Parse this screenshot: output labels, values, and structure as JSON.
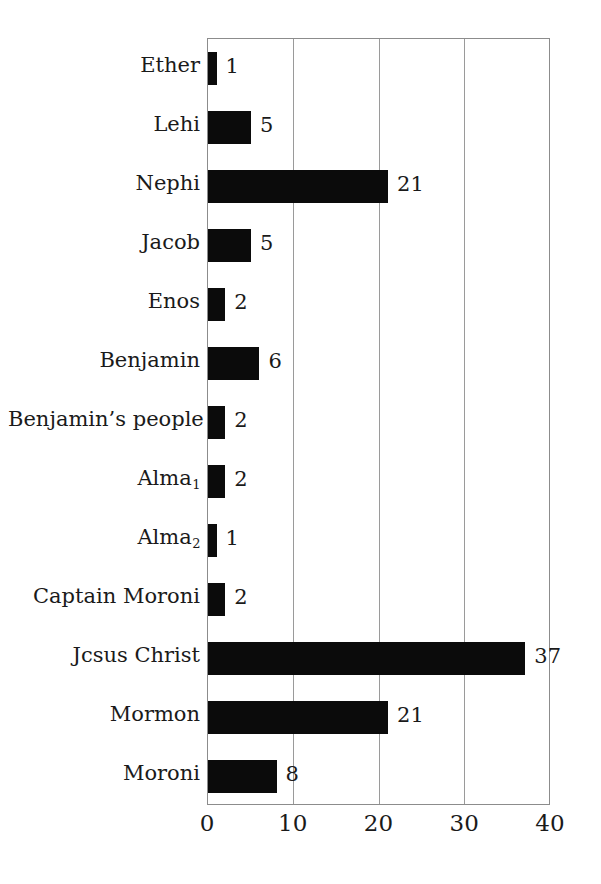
{
  "chart_data": {
    "type": "bar",
    "orientation": "horizontal",
    "title": "",
    "subtitle": "",
    "xlabel": "",
    "ylabel": "",
    "xlim": [
      0,
      40
    ],
    "xticks": [
      0,
      10,
      20,
      30,
      40
    ],
    "xtick_labels": [
      "0",
      "10",
      "20",
      "30",
      "40"
    ],
    "grid": true,
    "grid_axis": "x",
    "legend": false,
    "legend_position": "none",
    "bar_color": "#0b0b0b",
    "background_color": "#ffffff",
    "axis_color": "#8c8c8c",
    "value_labels_shown": true,
    "categories": [
      "Ether",
      "Lehi",
      "Nephi",
      "Jacob",
      "Enos",
      "Benjamin",
      "Benjamin’s people",
      "Alma₁",
      "Alma₂",
      "Captain Moroni",
      "Jcsus Christ",
      "Mormon",
      "Moroni"
    ],
    "values": [
      1,
      5,
      21,
      5,
      2,
      6,
      2,
      2,
      1,
      2,
      37,
      21,
      8
    ],
    "bars": [
      {
        "label": "Ether",
        "label_base": "Ether",
        "label_sub": "",
        "value": 1,
        "value_label": "1"
      },
      {
        "label": "Lehi",
        "label_base": "Lehi",
        "label_sub": "",
        "value": 5,
        "value_label": "5"
      },
      {
        "label": "Nephi",
        "label_base": "Nephi",
        "label_sub": "",
        "value": 21,
        "value_label": "21"
      },
      {
        "label": "Jacob",
        "label_base": "Jacob",
        "label_sub": "",
        "value": 5,
        "value_label": "5"
      },
      {
        "label": "Enos",
        "label_base": "Enos",
        "label_sub": "",
        "value": 2,
        "value_label": "2"
      },
      {
        "label": "Benjamin",
        "label_base": "Benjamin",
        "label_sub": "",
        "value": 6,
        "value_label": "6"
      },
      {
        "label": "Benjamin’s people",
        "label_base": "Benjamin’s people",
        "label_sub": "",
        "value": 2,
        "value_label": "2"
      },
      {
        "label": "Alma₁",
        "label_base": "Alma",
        "label_sub": "1",
        "value": 2,
        "value_label": "2"
      },
      {
        "label": "Alma₂",
        "label_base": "Alma",
        "label_sub": "2",
        "value": 1,
        "value_label": "1"
      },
      {
        "label": "Captain Moroni",
        "label_base": "Captain Moroni",
        "label_sub": "",
        "value": 2,
        "value_label": "2"
      },
      {
        "label": "Jcsus Christ",
        "label_base": "Jcsus Christ",
        "label_sub": "",
        "value": 37,
        "value_label": "37"
      },
      {
        "label": "Mormon",
        "label_base": "Mormon",
        "label_sub": "",
        "value": 21,
        "value_label": "21"
      },
      {
        "label": "Moroni",
        "label_base": "Moroni",
        "label_sub": "",
        "value": 8,
        "value_label": "8"
      }
    ]
  }
}
